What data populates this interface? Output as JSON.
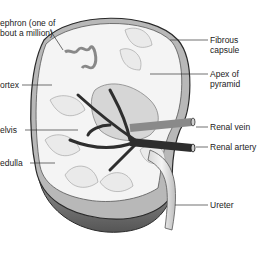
{
  "diagram": {
    "labels_left": [
      {
        "id": "nephron",
        "line1": "ephron (one of",
        "line2": "bout a million)"
      },
      {
        "id": "cortex",
        "line1": "ortex"
      },
      {
        "id": "pelvis",
        "line1": "elvis"
      },
      {
        "id": "medulla",
        "line1": "edulla"
      }
    ],
    "labels_right": [
      {
        "id": "fibrous-capsule",
        "line1": "Fibrous",
        "line2": "capsule"
      },
      {
        "id": "apex-of-pyramid",
        "line1": "Apex of",
        "line2": "pyramid"
      },
      {
        "id": "renal-vein",
        "line1": "Renal vein"
      },
      {
        "id": "renal-artery",
        "line1": "Renal artery"
      },
      {
        "id": "ureter",
        "line1": "Ureter"
      }
    ],
    "colors": {
      "outline": "#2a2a2a",
      "capsule": "#9a9a9a",
      "cortex_fill": "#f4f4f4",
      "shadow_base": "#6e6e6e",
      "vessel_dark": "#2e2e2e",
      "vessel_mid": "#8a8a8a",
      "ureter": "#e6e6e6",
      "leader_line": "#333333"
    }
  }
}
